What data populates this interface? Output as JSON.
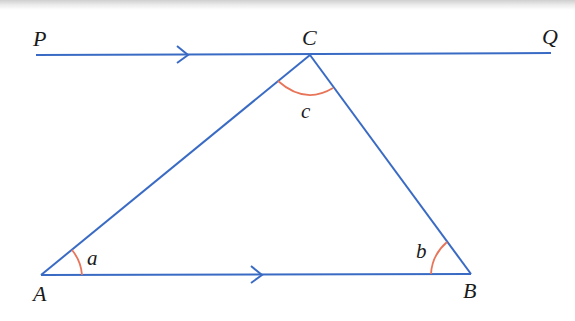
{
  "diagram": {
    "line_color": "#3a6bc4",
    "arc_color": "#e8755a",
    "points": {
      "P": "P",
      "Q": "Q",
      "C": "C",
      "A": "A",
      "B": "B"
    },
    "angles": {
      "a": "a",
      "b": "b",
      "c": "c"
    }
  }
}
